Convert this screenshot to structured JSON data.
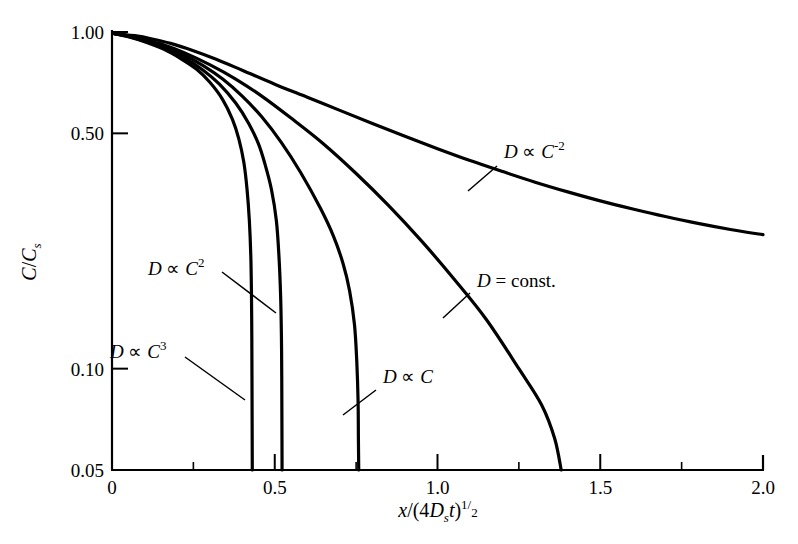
{
  "chart_data": {
    "type": "line",
    "title": "",
    "xlabel": "x/(4D_s t)^1/2",
    "ylabel": "C/C_s",
    "xlabel_parts": {
      "x": "x",
      "open": "/(4",
      "D": "D",
      "Dsub": "s",
      "t": "t",
      "close": ")",
      "exp_num": "1",
      "exp_slash": "/",
      "exp_den": "2"
    },
    "ylabel_parts": {
      "C1": "C",
      "slash": "/",
      "C2": "C",
      "sub": "s"
    },
    "xscale": "linear",
    "yscale": "log",
    "xlim": [
      0,
      2.0
    ],
    "ylim": [
      0.05,
      1.0
    ],
    "grid": false,
    "legend": "inline-annotations",
    "xticks": [
      {
        "value": 0,
        "label": "0"
      },
      {
        "value": 0.5,
        "label": "0.5"
      },
      {
        "value": 1.0,
        "label": "1.0"
      },
      {
        "value": 1.5,
        "label": "1.5"
      },
      {
        "value": 2.0,
        "label": "2.0"
      }
    ],
    "xminorticks": [
      0.25,
      0.75,
      1.25,
      1.75
    ],
    "yticks": [
      {
        "value": 1.0,
        "label": "1.00"
      },
      {
        "value": 0.5,
        "label": "0.50"
      },
      {
        "value": 0.1,
        "label": "0.10"
      },
      {
        "value": 0.05,
        "label": "0.05"
      }
    ],
    "series": [
      {
        "name": "D proportional to C^-2",
        "label": "D ∝ C⁻²",
        "label_parts": {
          "D": "D",
          "prop": "∝",
          "C": "C",
          "exp": "-2"
        },
        "points": [
          [
            0.005,
            0.99
          ],
          [
            0.03,
            0.985
          ],
          [
            0.07,
            0.975
          ],
          [
            0.12,
            0.955
          ],
          [
            0.18,
            0.925
          ],
          [
            0.25,
            0.88
          ],
          [
            0.32,
            0.83
          ],
          [
            0.4,
            0.77
          ],
          [
            0.5,
            0.7
          ],
          [
            0.6,
            0.64
          ],
          [
            0.7,
            0.585
          ],
          [
            0.8,
            0.535
          ],
          [
            0.9,
            0.49
          ],
          [
            1.0,
            0.45
          ],
          [
            1.1,
            0.415
          ],
          [
            1.2,
            0.385
          ],
          [
            1.3,
            0.358
          ],
          [
            1.4,
            0.335
          ],
          [
            1.5,
            0.315
          ],
          [
            1.6,
            0.298
          ],
          [
            1.7,
            0.283
          ],
          [
            1.8,
            0.27
          ],
          [
            1.9,
            0.259
          ],
          [
            2.0,
            0.25
          ]
        ]
      },
      {
        "name": "D = const.",
        "label": "D = const.",
        "label_parts": {
          "D": "D",
          "eq": "= const."
        },
        "points": [
          [
            0.005,
            0.99
          ],
          [
            0.05,
            0.975
          ],
          [
            0.1,
            0.95
          ],
          [
            0.16,
            0.915
          ],
          [
            0.22,
            0.87
          ],
          [
            0.3,
            0.8
          ],
          [
            0.38,
            0.725
          ],
          [
            0.46,
            0.645
          ],
          [
            0.55,
            0.555
          ],
          [
            0.65,
            0.465
          ],
          [
            0.75,
            0.38
          ],
          [
            0.85,
            0.305
          ],
          [
            0.95,
            0.24
          ],
          [
            1.05,
            0.185
          ],
          [
            1.15,
            0.14
          ],
          [
            1.25,
            0.1
          ],
          [
            1.32,
            0.078
          ],
          [
            1.36,
            0.062
          ],
          [
            1.38,
            0.05
          ]
        ]
      },
      {
        "name": "D proportional to C",
        "label": "D ∝ C",
        "label_parts": {
          "D": "D",
          "prop": "∝",
          "C": "C",
          "exp": ""
        },
        "points": [
          [
            0.005,
            0.99
          ],
          [
            0.05,
            0.972
          ],
          [
            0.1,
            0.945
          ],
          [
            0.16,
            0.905
          ],
          [
            0.22,
            0.855
          ],
          [
            0.28,
            0.795
          ],
          [
            0.34,
            0.725
          ],
          [
            0.4,
            0.645
          ],
          [
            0.46,
            0.56
          ],
          [
            0.52,
            0.47
          ],
          [
            0.58,
            0.382
          ],
          [
            0.64,
            0.3
          ],
          [
            0.68,
            0.248
          ],
          [
            0.71,
            0.205
          ],
          [
            0.73,
            0.17
          ],
          [
            0.745,
            0.135
          ],
          [
            0.752,
            0.105
          ],
          [
            0.756,
            0.08
          ],
          [
            0.757,
            0.062
          ],
          [
            0.758,
            0.05
          ]
        ]
      },
      {
        "name": "D proportional to C^2",
        "label": "D ∝ C²",
        "label_parts": {
          "D": "D",
          "prop": "∝",
          "C": "C",
          "exp": "2"
        },
        "points": [
          [
            0.005,
            0.99
          ],
          [
            0.05,
            0.97
          ],
          [
            0.1,
            0.94
          ],
          [
            0.16,
            0.895
          ],
          [
            0.22,
            0.84
          ],
          [
            0.28,
            0.77
          ],
          [
            0.33,
            0.7
          ],
          [
            0.38,
            0.615
          ],
          [
            0.42,
            0.535
          ],
          [
            0.45,
            0.465
          ],
          [
            0.47,
            0.405
          ],
          [
            0.49,
            0.34
          ],
          [
            0.505,
            0.275
          ],
          [
            0.513,
            0.215
          ],
          [
            0.518,
            0.165
          ],
          [
            0.5205,
            0.125
          ],
          [
            0.5215,
            0.095
          ],
          [
            0.522,
            0.07
          ],
          [
            0.5225,
            0.05
          ]
        ]
      },
      {
        "name": "D proportional to C^3",
        "label": "D ∝ C³",
        "label_parts": {
          "D": "D",
          "prop": "∝",
          "C": "C",
          "exp": "3"
        },
        "points": [
          [
            0.005,
            0.99
          ],
          [
            0.05,
            0.968
          ],
          [
            0.1,
            0.935
          ],
          [
            0.16,
            0.888
          ],
          [
            0.21,
            0.835
          ],
          [
            0.26,
            0.775
          ],
          [
            0.3,
            0.71
          ],
          [
            0.34,
            0.63
          ],
          [
            0.37,
            0.55
          ],
          [
            0.39,
            0.48
          ],
          [
            0.405,
            0.41
          ],
          [
            0.415,
            0.34
          ],
          [
            0.422,
            0.275
          ],
          [
            0.4265,
            0.215
          ],
          [
            0.4285,
            0.165
          ],
          [
            0.4295,
            0.125
          ],
          [
            0.43,
            0.095
          ],
          [
            0.4305,
            0.07
          ],
          [
            0.431,
            0.05
          ]
        ]
      }
    ],
    "annotations": [
      {
        "name": "label-d-prop-c-minus-2",
        "text": "D ∝ C⁻²",
        "text_x": 504,
        "text_y": 158,
        "leader": [
          [
            497,
            166
          ],
          [
            468,
            191
          ]
        ]
      },
      {
        "name": "label-d-const",
        "text": "D = const.",
        "text_x": 477,
        "text_y": 287,
        "leader": [
          [
            470,
            293
          ],
          [
            443,
            318
          ]
        ]
      },
      {
        "name": "label-d-prop-c",
        "text": "D ∝ C",
        "text_x": 383,
        "text_y": 383,
        "leader": [
          [
            376,
            390
          ],
          [
            343,
            415
          ]
        ]
      },
      {
        "name": "label-d-prop-c2",
        "text": "D ∝ C²",
        "text_x": 148,
        "text_y": 275,
        "leader": [
          [
            222,
            272
          ],
          [
            276,
            313
          ]
        ]
      },
      {
        "name": "label-d-prop-c3",
        "text": "D ∝ C³",
        "text_x": 110,
        "text_y": 358,
        "leader": [
          [
            185,
            357
          ],
          [
            245,
            400
          ]
        ]
      }
    ]
  }
}
